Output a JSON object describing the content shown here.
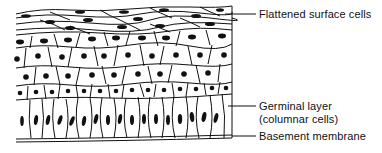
{
  "diagram": {
    "colors": {
      "ink": "#111111",
      "background": "#ffffff"
    },
    "labels": [
      {
        "id": "flattened",
        "text": "Flattened surface cells",
        "y": 14
      },
      {
        "id": "germinal",
        "line1": "Germinal layer",
        "line2": "(columnar cells)",
        "y": 106
      },
      {
        "id": "basement",
        "text": "Basement membrane",
        "y": 136
      }
    ],
    "layers": [
      {
        "name": "flattened surface cells",
        "rows": 3
      },
      {
        "name": "polyhedral cells",
        "rows": 3
      },
      {
        "name": "germinal layer (columnar cells)",
        "rows": 1
      },
      {
        "name": "basement membrane",
        "rows": 1
      }
    ]
  }
}
